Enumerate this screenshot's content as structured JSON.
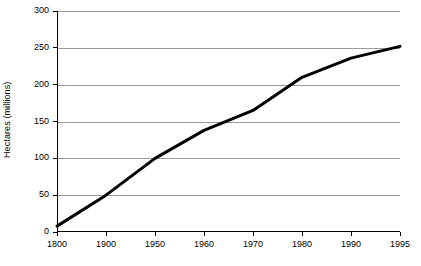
{
  "chart_data": {
    "type": "line",
    "title": "",
    "subtitle": "",
    "xlabel": "",
    "ylabel": "Hectares (millions)",
    "categories": [
      "1800",
      "1900",
      "1950",
      "1960",
      "1970",
      "1980",
      "1990",
      "1995"
    ],
    "series": [
      {
        "name": "Hectares",
        "values": [
          8,
          50,
          100,
          138,
          165,
          210,
          236,
          252
        ],
        "color": "#000000",
        "line_width": 3
      }
    ],
    "ylim": [
      0,
      300
    ],
    "yticks": [
      0,
      50,
      100,
      150,
      200,
      250,
      300
    ],
    "ytick_labels": [
      "0",
      "50",
      "100",
      "150",
      "200",
      "250",
      "300"
    ],
    "grid": "horizontal",
    "legend": "none",
    "axis_color": "#000000",
    "gridline_color": "#9a9a9a",
    "background": "#ffffff"
  }
}
